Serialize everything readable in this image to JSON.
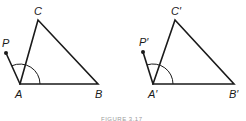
{
  "figure": {
    "caption": "FIGURE 3.17",
    "left": {
      "labels": {
        "P": "P",
        "A": "A",
        "B": "B",
        "C": "C"
      },
      "points": {
        "P": [
          6,
          53
        ],
        "A": [
          20,
          84
        ],
        "B": [
          98,
          84
        ],
        "C": [
          38,
          20
        ]
      },
      "arc_radius": 20
    },
    "right": {
      "labels": {
        "P": "P′",
        "A": "A′",
        "B": "B′",
        "C": "C′"
      },
      "points": {
        "P": [
          143,
          52
        ],
        "A": [
          153,
          84
        ],
        "B": [
          234,
          84
        ],
        "C": [
          175,
          20
        ]
      },
      "arc_radius": 20
    },
    "colors": {
      "line": "#1a1a1a",
      "caption": "#9a9a9a"
    }
  }
}
